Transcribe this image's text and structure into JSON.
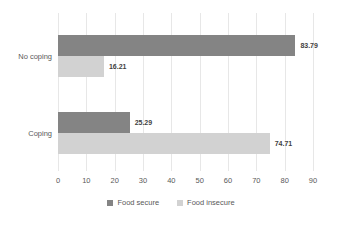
{
  "chart_data": {
    "type": "bar",
    "orientation": "horizontal",
    "title": "",
    "xlabel": "",
    "ylabel": "",
    "categories": [
      "No coping",
      "Coping"
    ],
    "series": [
      {
        "name": "Food secure",
        "color": "#848484",
        "values": [
          83.79,
          25.29
        ],
        "labels": [
          "83.79",
          "25.29"
        ]
      },
      {
        "name": "Food insecure",
        "color": "#d2d2d2",
        "values": [
          16.21,
          74.71
        ],
        "labels": [
          "16.21",
          "74.71"
        ]
      }
    ],
    "xlim": [
      0,
      90
    ],
    "xticks": [
      "0",
      "10",
      "20",
      "30",
      "40",
      "50",
      "60",
      "70",
      "80",
      "90"
    ],
    "grid": true,
    "legend_position": "bottom"
  }
}
